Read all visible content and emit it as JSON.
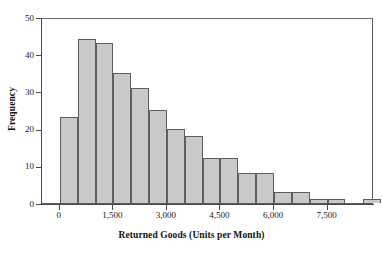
{
  "chart_data": {
    "type": "bar",
    "title": "",
    "subtitle": "",
    "xlabel": "Returned Goods (Units per Month)",
    "ylabel": "Frequency",
    "xlim": [
      -500,
      8800
    ],
    "ylim": [
      0,
      50
    ],
    "grid": false,
    "legend": null,
    "bin_width": 500,
    "x_tick_values": [
      0,
      1500,
      3000,
      4500,
      6000,
      7500
    ],
    "x_tick_labels": [
      "0",
      "1,500",
      "3,000",
      "4,500",
      "6,000",
      "7,500"
    ],
    "y_tick_values": [
      0,
      10,
      20,
      30,
      40,
      50
    ],
    "y_tick_labels": [
      "0",
      "10",
      "20",
      "30",
      "40",
      "50"
    ],
    "bin_starts": [
      0,
      500,
      1000,
      1500,
      2000,
      2500,
      3000,
      3500,
      4000,
      4500,
      5000,
      5500,
      6000,
      6500,
      7000,
      7500,
      8500
    ],
    "categories": [
      "0-500",
      "500-1,000",
      "1,000-1,500",
      "1,500-2,000",
      "2,000-2,500",
      "2,500-3,000",
      "3,000-3,500",
      "3,500-4,000",
      "4,000-4,500",
      "4,500-5,000",
      "5,000-5,500",
      "5,500-6,000",
      "6,000-6,500",
      "6,500-7,000",
      "7,000-7,500",
      "7,500-8,000",
      "8,500-9,000"
    ],
    "values": [
      23,
      44,
      43,
      35,
      31,
      25,
      20,
      18,
      12,
      12,
      8,
      8,
      3,
      3,
      1,
      1,
      1
    ],
    "bar_fill_color": "#c9c9c9",
    "bar_edge_color": "#5e5e5e",
    "axis_color": "#4a4a4a",
    "background_color": "#ffffff"
  },
  "axes": {
    "x_title": "Returned Goods (Units per Month)",
    "y_title": "Frequency"
  }
}
